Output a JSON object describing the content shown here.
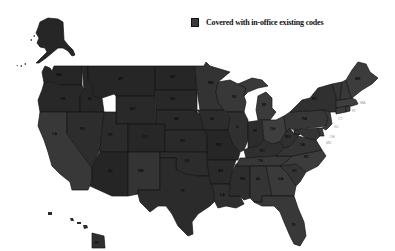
{
  "legend": {
    "label": "Covered with in-office existing codes",
    "swatch_color": "#3a3a3a"
  },
  "map": {
    "region": "United States",
    "fill_dark": "#242424",
    "fill_mid": "#343434",
    "fill_light": "#414141",
    "border_color": "#151515",
    "all_states_covered": true,
    "states": [
      {
        "abbr": "WA"
      },
      {
        "abbr": "OR"
      },
      {
        "abbr": "CA"
      },
      {
        "abbr": "ID"
      },
      {
        "abbr": "NV"
      },
      {
        "abbr": "MT"
      },
      {
        "abbr": "WY"
      },
      {
        "abbr": "UT"
      },
      {
        "abbr": "AZ"
      },
      {
        "abbr": "CO"
      },
      {
        "abbr": "NM"
      },
      {
        "abbr": "ND"
      },
      {
        "abbr": "SD"
      },
      {
        "abbr": "NE"
      },
      {
        "abbr": "KS"
      },
      {
        "abbr": "OK"
      },
      {
        "abbr": "TX"
      },
      {
        "abbr": "MN"
      },
      {
        "abbr": "IA"
      },
      {
        "abbr": "MO"
      },
      {
        "abbr": "AR"
      },
      {
        "abbr": "LA"
      },
      {
        "abbr": "WI"
      },
      {
        "abbr": "IL"
      },
      {
        "abbr": "MS"
      },
      {
        "abbr": "MI"
      },
      {
        "abbr": "IN"
      },
      {
        "abbr": "KY"
      },
      {
        "abbr": "TN"
      },
      {
        "abbr": "AL"
      },
      {
        "abbr": "OH"
      },
      {
        "abbr": "GA"
      },
      {
        "abbr": "FL"
      },
      {
        "abbr": "SC"
      },
      {
        "abbr": "NC"
      },
      {
        "abbr": "VA"
      },
      {
        "abbr": "WV"
      },
      {
        "abbr": "PA"
      },
      {
        "abbr": "NY"
      },
      {
        "abbr": "VT"
      },
      {
        "abbr": "NH"
      },
      {
        "abbr": "ME"
      },
      {
        "abbr": "MA"
      },
      {
        "abbr": "RI"
      },
      {
        "abbr": "CT"
      },
      {
        "abbr": "NJ"
      },
      {
        "abbr": "DE"
      },
      {
        "abbr": "MD"
      },
      {
        "abbr": "AK"
      },
      {
        "abbr": "HI"
      }
    ]
  }
}
